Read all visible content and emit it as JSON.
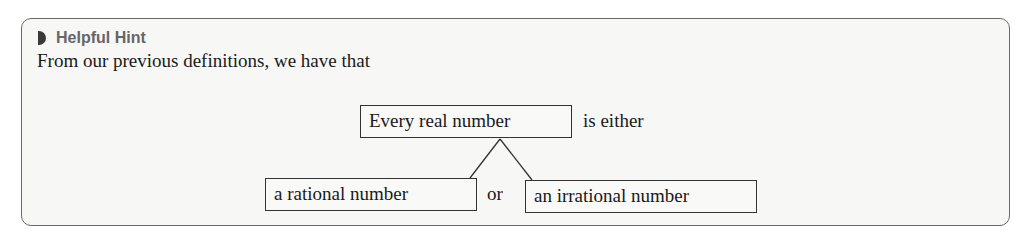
{
  "hint": {
    "icon": "half-circle-bullet-icon",
    "title": "Helpful Hint",
    "intro": "From our previous definitions, we have that"
  },
  "diagram": {
    "root": "Every real number",
    "root_suffix": "is either",
    "left_child": "a rational number",
    "connector": "or",
    "right_child": "an irrational number"
  }
}
